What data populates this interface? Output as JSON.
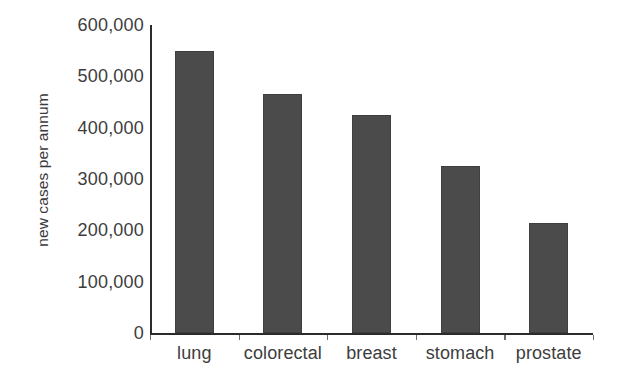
{
  "chart_data": {
    "type": "bar",
    "title": "",
    "subtitle": "",
    "xlabel": "",
    "ylabel": "new cases per annum",
    "categories": [
      "lung",
      "colorectal",
      "breast",
      "stomach",
      "prostate"
    ],
    "values": [
      550000,
      465000,
      425000,
      325000,
      215000
    ],
    "series": [
      {
        "name": "new cases per annum",
        "values": [
          550000,
          465000,
          425000,
          325000,
          215000
        ]
      }
    ],
    "ylim": [
      0,
      600000
    ],
    "ytick_values": [
      0,
      100000,
      200000,
      300000,
      400000,
      500000,
      600000
    ],
    "ytick_labels": [
      "0",
      "100,000",
      "200,000",
      "300,000",
      "400,000",
      "500,000",
      "600,000"
    ],
    "grid": false,
    "legend": false,
    "legend_position": "none",
    "bar_color": "#4b4b4b",
    "axis_color": "#2b2b2b",
    "text_color": "#3d3d3d",
    "background_color": "#ffffff"
  }
}
